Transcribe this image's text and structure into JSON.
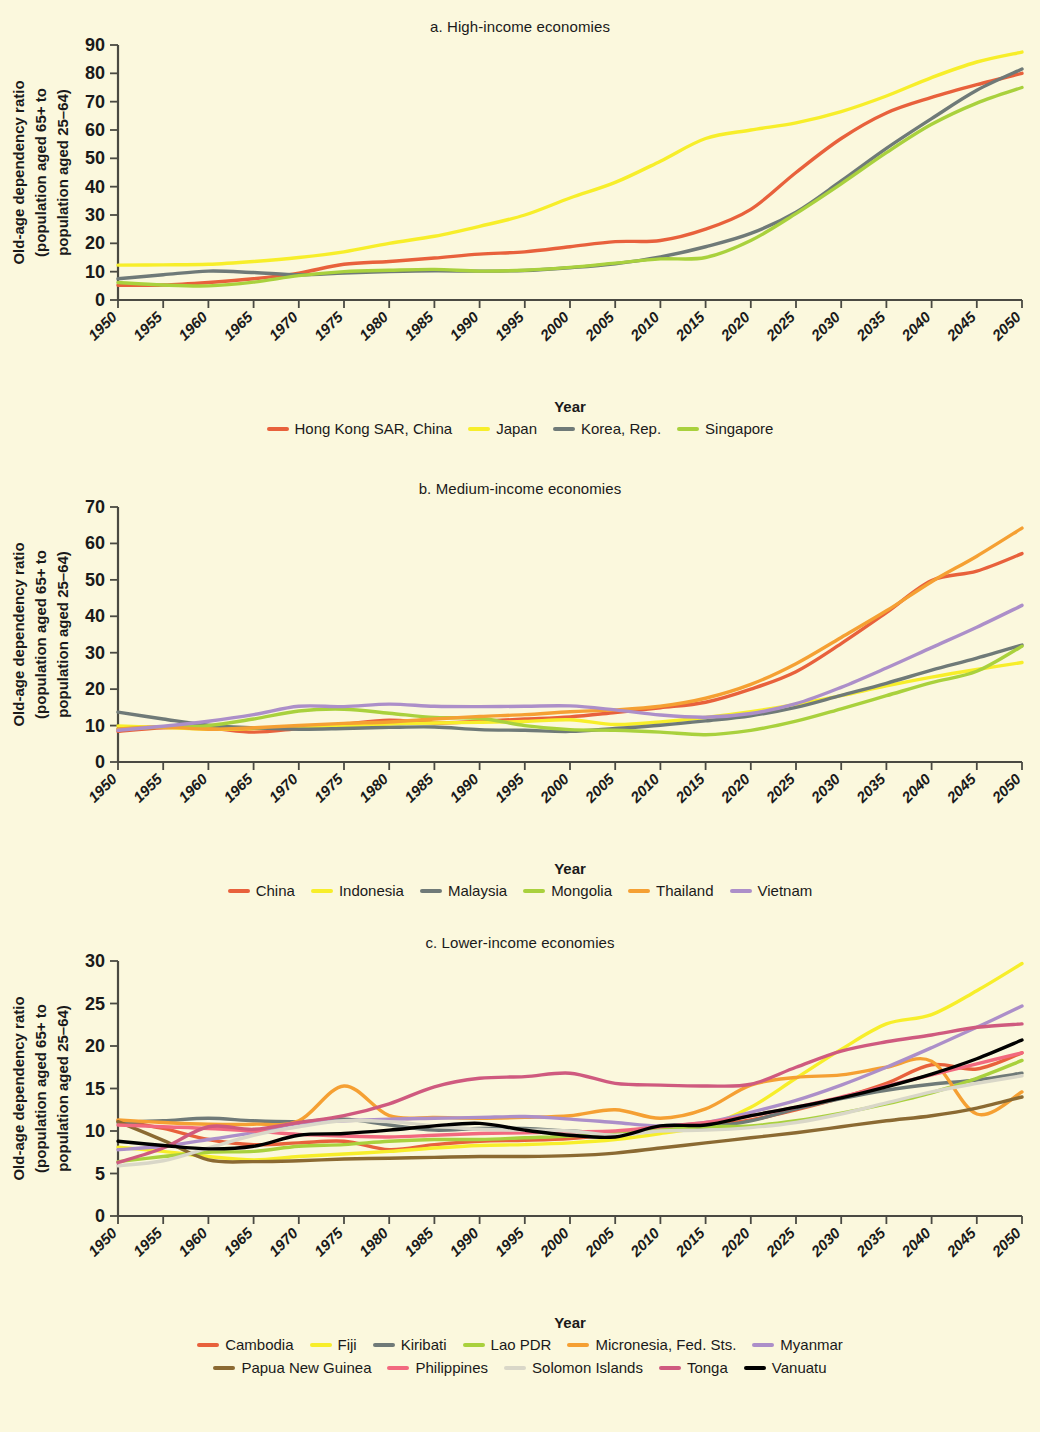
{
  "figure": {
    "background_color": "#fbf8dd",
    "axis_color": "#4a4a42",
    "y_axis_title": "Old-age dependency ratio (population aged 65+ to population aged 25–64)",
    "y_axis_title_line1": "Old-age dependency ratio",
    "y_axis_title_line2": "(population aged 65+ to",
    "y_axis_title_line3": "population aged 25–64)",
    "x_axis_title": "Year"
  },
  "chart_data": [
    {
      "type": "line",
      "title": "a. High-income economies",
      "xlabel": "Year",
      "ylabel": "Old-age dependency ratio (population aged 65+ to population aged 25–64)",
      "x": [
        1950,
        1955,
        1960,
        1965,
        1970,
        1975,
        1980,
        1985,
        1990,
        1995,
        2000,
        2005,
        2010,
        2015,
        2020,
        2025,
        2030,
        2035,
        2040,
        2045,
        2050
      ],
      "xlim": [
        1950,
        2050
      ],
      "ylim": [
        0,
        90
      ],
      "yticks": [
        0,
        10,
        20,
        30,
        40,
        50,
        60,
        70,
        80,
        90
      ],
      "xticks": [
        "1950",
        "1955",
        "1960",
        "1965",
        "1970",
        "1975",
        "1980",
        "1985",
        "1990",
        "1995",
        "2000",
        "2005",
        "2010",
        "2015",
        "2020",
        "2025",
        "2030",
        "2035",
        "2040",
        "2045",
        "2050"
      ],
      "grid": false,
      "legend_position": "bottom",
      "series": [
        {
          "name": "Hong Kong SAR, China",
          "color": "#e8613c",
          "values": [
            5.2,
            5.3,
            6.2,
            7.5,
            9.5,
            12.6,
            13.6,
            14.8,
            16.2,
            17.0,
            18.8,
            20.6,
            21.0,
            25.0,
            32.0,
            45.0,
            57.0,
            66.0,
            71.5,
            76.0,
            80.0
          ]
        },
        {
          "name": "Japan",
          "color": "#f7ee2a",
          "values": [
            12.3,
            12.4,
            12.6,
            13.6,
            15.0,
            17.0,
            20.0,
            22.5,
            26.0,
            30.0,
            36.0,
            41.5,
            49.0,
            57.0,
            60.0,
            62.5,
            66.5,
            72.0,
            78.5,
            84.0,
            87.5
          ]
        },
        {
          "name": "Korea, Rep.",
          "color": "#6f7a78",
          "values": [
            7.5,
            8.9,
            10.2,
            9.7,
            8.9,
            9.5,
            10.0,
            10.3,
            10.2,
            10.4,
            11.4,
            12.8,
            15.2,
            18.8,
            23.5,
            31.0,
            42.0,
            53.5,
            64.0,
            74.0,
            81.5
          ]
        },
        {
          "name": "Singapore",
          "color": "#a9d13d",
          "values": [
            6.2,
            5.3,
            5.0,
            6.3,
            8.6,
            10.0,
            10.5,
            10.8,
            10.2,
            10.5,
            11.5,
            13.0,
            14.5,
            15.0,
            21.0,
            30.5,
            41.0,
            52.0,
            62.0,
            69.5,
            75.0
          ]
        }
      ]
    },
    {
      "type": "line",
      "title": "b. Medium-income economies",
      "xlabel": "Year",
      "ylabel": "Old-age dependency ratio (population aged 65+ to population aged 25–64)",
      "x": [
        1950,
        1955,
        1960,
        1965,
        1970,
        1975,
        1980,
        1985,
        1990,
        1995,
        2000,
        2005,
        2010,
        2015,
        2020,
        2025,
        2030,
        2035,
        2040,
        2045,
        2050
      ],
      "xlim": [
        1950,
        2050
      ],
      "ylim": [
        0,
        70
      ],
      "yticks": [
        0,
        10,
        20,
        30,
        40,
        50,
        60,
        70
      ],
      "xticks": [
        "1950",
        "1955",
        "1960",
        "1965",
        "1970",
        "1975",
        "1980",
        "1985",
        "1990",
        "1995",
        "2000",
        "2005",
        "2010",
        "2015",
        "2020",
        "2025",
        "2030",
        "2035",
        "2040",
        "2045",
        "2050"
      ],
      "grid": false,
      "legend_position": "bottom",
      "series": [
        {
          "name": "China",
          "color": "#e8613c",
          "values": [
            8.4,
            9.4,
            9.3,
            8.2,
            9.2,
            10.4,
            11.5,
            10.7,
            11.2,
            11.8,
            12.4,
            13.6,
            14.9,
            16.4,
            20.0,
            24.8,
            32.5,
            41.0,
            49.8,
            52.4,
            57.2
          ]
        },
        {
          "name": "Indonesia",
          "color": "#f7ee2a",
          "values": [
            9.9,
            9.5,
            9.0,
            9.2,
            9.6,
            9.9,
            10.4,
            10.7,
            10.9,
            11.1,
            11.6,
            10.3,
            11.0,
            12.2,
            13.8,
            15.8,
            18.2,
            20.9,
            23.3,
            25.4,
            27.3
          ]
        },
        {
          "name": "Malaysia",
          "color": "#6f7a78",
          "values": [
            13.7,
            11.8,
            10.1,
            9.4,
            9.0,
            9.2,
            9.5,
            9.6,
            8.9,
            8.7,
            8.4,
            9.2,
            10.1,
            11.3,
            12.7,
            15.0,
            18.3,
            21.6,
            25.2,
            28.5,
            32.1
          ]
        },
        {
          "name": "Mongolia",
          "color": "#a9d13d",
          "values": [
            9.0,
            9.6,
            10.0,
            11.8,
            14.0,
            14.5,
            13.4,
            12.2,
            12.0,
            10.0,
            8.9,
            8.7,
            8.2,
            7.5,
            8.7,
            11.2,
            14.6,
            18.2,
            21.8,
            24.9,
            31.8
          ]
        },
        {
          "name": "Thailand",
          "color": "#f5a033",
          "values": [
            9.1,
            9.6,
            9.0,
            9.4,
            10.0,
            10.6,
            11.0,
            11.8,
            12.5,
            13.0,
            13.8,
            14.3,
            15.3,
            17.5,
            21.3,
            27.0,
            34.2,
            41.5,
            49.5,
            56.5,
            64.2
          ]
        },
        {
          "name": "Vietnam",
          "color": "#ac8fc9",
          "values": [
            8.7,
            9.8,
            11.2,
            13.0,
            15.3,
            15.2,
            15.9,
            15.3,
            15.2,
            15.3,
            15.4,
            14.3,
            12.9,
            12.3,
            13.3,
            16.0,
            20.5,
            25.8,
            31.4,
            37.0,
            43.0
          ]
        }
      ]
    },
    {
      "type": "line",
      "title": "c. Lower-income economies",
      "xlabel": "Year",
      "ylabel": "Old-age dependency ratio (population aged 65+ to population aged 25–64)",
      "x": [
        1950,
        1955,
        1960,
        1965,
        1970,
        1975,
        1980,
        1985,
        1990,
        1995,
        2000,
        2005,
        2010,
        2015,
        2020,
        2025,
        2030,
        2035,
        2040,
        2045,
        2050
      ],
      "xlim": [
        1950,
        2050
      ],
      "ylim": [
        0,
        30
      ],
      "yticks": [
        0,
        5,
        10,
        15,
        20,
        25,
        30
      ],
      "xticks": [
        "1950",
        "1955",
        "1960",
        "1965",
        "1970",
        "1975",
        "1980",
        "1985",
        "1990",
        "1995",
        "2000",
        "2005",
        "2010",
        "2015",
        "2020",
        "2025",
        "2030",
        "2035",
        "2040",
        "2045",
        "2050"
      ],
      "grid": false,
      "legend_position": "bottom",
      "series": [
        {
          "name": "Cambodia",
          "color": "#e8613c",
          "values": [
            11.2,
            10.3,
            9.0,
            8.4,
            8.6,
            8.8,
            7.8,
            8.4,
            8.8,
            8.9,
            9.1,
            9.6,
            10.2,
            10.6,
            11.3,
            12.5,
            13.9,
            15.6,
            17.8,
            17.3,
            19.2
          ]
        },
        {
          "name": "Fiji",
          "color": "#f7ee2a",
          "values": [
            8.1,
            7.6,
            7.0,
            6.6,
            7.0,
            7.3,
            7.6,
            8.0,
            8.3,
            8.4,
            8.6,
            9.0,
            9.7,
            10.6,
            12.8,
            16.2,
            19.6,
            22.6,
            23.7,
            26.5,
            29.7
          ]
        },
        {
          "name": "Kiribati",
          "color": "#6f7a78",
          "values": [
            11.0,
            11.2,
            11.5,
            11.2,
            11.1,
            11.4,
            10.7,
            10.1,
            10.3,
            10.3,
            10.0,
            9.8,
            10.4,
            10.5,
            11.2,
            12.6,
            13.8,
            14.8,
            15.5,
            16.0,
            16.8
          ]
        },
        {
          "name": "Lao PDR",
          "color": "#a9d13d",
          "values": [
            6.4,
            7.0,
            7.5,
            7.6,
            8.2,
            8.4,
            8.8,
            9.0,
            9.0,
            9.2,
            9.4,
            9.8,
            10.2,
            10.5,
            10.6,
            11.2,
            12.1,
            13.2,
            14.5,
            16.2,
            18.3
          ]
        },
        {
          "name": "Micronesia, Fed. Sts.",
          "color": "#f5a033",
          "values": [
            11.3,
            11.0,
            10.8,
            10.8,
            11.2,
            15.3,
            11.8,
            11.6,
            11.5,
            11.6,
            11.8,
            12.5,
            11.5,
            12.6,
            15.4,
            16.3,
            16.6,
            17.5,
            18.2,
            12.0,
            14.6
          ]
        },
        {
          "name": "Myanmar",
          "color": "#ac8fc9",
          "values": [
            7.8,
            8.2,
            9.0,
            9.8,
            10.9,
            11.2,
            11.4,
            11.5,
            11.6,
            11.7,
            11.4,
            11.0,
            10.6,
            11.0,
            12.2,
            13.6,
            15.4,
            17.5,
            19.8,
            22.2,
            24.7
          ]
        },
        {
          "name": "Papua New Guinea",
          "color": "#8b6a32",
          "values": [
            11.1,
            8.9,
            6.6,
            6.4,
            6.5,
            6.7,
            6.8,
            6.9,
            7.0,
            7.0,
            7.1,
            7.4,
            8.0,
            8.6,
            9.2,
            9.8,
            10.5,
            11.2,
            11.8,
            12.7,
            14.0
          ]
        },
        {
          "name": "Philippines",
          "color": "#f2697f",
          "values": [
            10.7,
            10.5,
            10.3,
            10.0,
            9.6,
            9.4,
            9.3,
            9.5,
            9.7,
            9.8,
            9.9,
            10.0,
            10.5,
            11.0,
            11.8,
            12.8,
            14.0,
            15.3,
            16.6,
            17.9,
            19.2
          ]
        },
        {
          "name": "Solomon Islands",
          "color": "#d9d7c8",
          "values": [
            5.9,
            6.5,
            8.0,
            9.5,
            10.5,
            11.2,
            11.1,
            10.6,
            10.2,
            10.1,
            10.0,
            9.5,
            10.0,
            10.1,
            10.4,
            11.0,
            12.0,
            13.3,
            14.6,
            15.6,
            16.5
          ]
        },
        {
          "name": "Tonga",
          "color": "#cf5a7f",
          "values": [
            6.3,
            8.0,
            10.5,
            10.2,
            11.0,
            11.8,
            13.2,
            15.2,
            16.2,
            16.4,
            16.8,
            15.6,
            15.4,
            15.3,
            15.5,
            17.5,
            19.4,
            20.5,
            21.3,
            22.2,
            22.6
          ]
        },
        {
          "name": "Vanuatu",
          "color": "#000000",
          "values": [
            8.8,
            8.3,
            7.9,
            8.2,
            9.5,
            9.7,
            10.1,
            10.6,
            10.9,
            10.1,
            9.5,
            9.3,
            10.6,
            10.7,
            11.8,
            12.8,
            13.9,
            15.2,
            16.7,
            18.5,
            20.7
          ]
        }
      ]
    }
  ],
  "panels": [
    {
      "id": "panel-a",
      "title": "a. High-income economies",
      "legend": [
        {
          "label": "Hong Kong SAR, China",
          "color": "#e8613c"
        },
        {
          "label": "Japan",
          "color": "#f7ee2a"
        },
        {
          "label": "Korea, Rep.",
          "color": "#6f7a78"
        },
        {
          "label": "Singapore",
          "color": "#a9d13d"
        }
      ]
    },
    {
      "id": "panel-b",
      "title": "b. Medium-income economies",
      "legend": [
        {
          "label": "China",
          "color": "#e8613c"
        },
        {
          "label": "Indonesia",
          "color": "#f7ee2a"
        },
        {
          "label": "Malaysia",
          "color": "#6f7a78"
        },
        {
          "label": "Mongolia",
          "color": "#a9d13d"
        },
        {
          "label": "Thailand",
          "color": "#f5a033"
        },
        {
          "label": "Vietnam",
          "color": "#ac8fc9"
        }
      ]
    },
    {
      "id": "panel-c",
      "title": "c. Lower-income economies",
      "legend_row1": [
        {
          "label": "Cambodia",
          "color": "#e8613c"
        },
        {
          "label": "Fiji",
          "color": "#f7ee2a"
        },
        {
          "label": "Kiribati",
          "color": "#6f7a78"
        },
        {
          "label": "Lao PDR",
          "color": "#a9d13d"
        },
        {
          "label": "Micronesia, Fed. Sts.",
          "color": "#f5a033"
        },
        {
          "label": "Myanmar",
          "color": "#ac8fc9"
        }
      ],
      "legend_row2": [
        {
          "label": "Papua New Guinea",
          "color": "#8b6a32"
        },
        {
          "label": "Philippines",
          "color": "#f2697f"
        },
        {
          "label": "Solomon Islands",
          "color": "#d9d7c8"
        },
        {
          "label": "Tonga",
          "color": "#cf5a7f"
        },
        {
          "label": "Vanuatu",
          "color": "#000000"
        }
      ]
    }
  ]
}
